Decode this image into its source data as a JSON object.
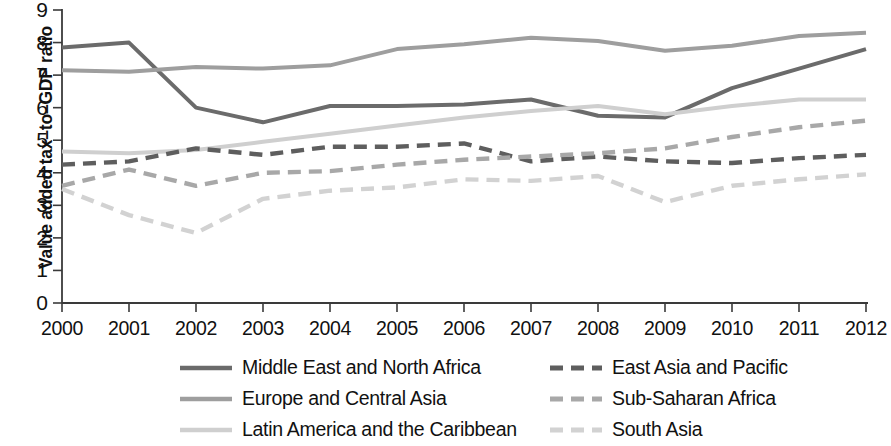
{
  "chart_data": {
    "type": "line",
    "title": "",
    "xlabel": "",
    "ylabel": "Value added tax–to–GDP ratio",
    "x": [
      2000,
      2001,
      2002,
      2003,
      2004,
      2005,
      2006,
      2007,
      2008,
      2009,
      2010,
      2011,
      2012
    ],
    "categories": [
      "2000",
      "2001",
      "2002",
      "2003",
      "2004",
      "2005",
      "2006",
      "2007",
      "2008",
      "2009",
      "2010",
      "2011",
      "2012"
    ],
    "xlim": [
      2000,
      2012
    ],
    "ylim": [
      0,
      9
    ],
    "yticks": [
      0,
      1,
      2,
      3,
      4,
      5,
      6,
      7,
      8,
      9
    ],
    "grid": false,
    "legend_position": "bottom",
    "series": [
      {
        "name": "Middle East and North Africa",
        "style": "solid",
        "color": "#6b6b6b",
        "values": [
          7.85,
          8.0,
          6.0,
          5.55,
          6.05,
          6.05,
          6.1,
          6.25,
          5.75,
          5.7,
          6.6,
          7.2,
          7.8
        ]
      },
      {
        "name": "Europe and Central Asia",
        "style": "solid",
        "color": "#9e9e9e",
        "values": [
          7.15,
          7.1,
          7.25,
          7.2,
          7.3,
          7.8,
          7.95,
          8.15,
          8.05,
          7.75,
          7.9,
          8.2,
          8.3
        ]
      },
      {
        "name": "Latin America and the Caribbean",
        "style": "solid",
        "color": "#cfcfcf",
        "values": [
          4.65,
          4.6,
          4.7,
          4.95,
          5.2,
          5.45,
          5.7,
          5.9,
          6.05,
          5.8,
          6.05,
          6.25,
          6.25
        ]
      },
      {
        "name": "East Asia and Pacific",
        "style": "dashed",
        "color": "#5e5e5e",
        "values": [
          4.25,
          4.35,
          4.75,
          4.55,
          4.8,
          4.8,
          4.9,
          4.35,
          4.5,
          4.35,
          4.3,
          4.45,
          4.55
        ]
      },
      {
        "name": "Sub-Saharan Africa",
        "style": "dashed",
        "color": "#a8a8a8",
        "values": [
          3.6,
          4.1,
          3.6,
          4.0,
          4.05,
          4.25,
          4.4,
          4.5,
          4.6,
          4.75,
          5.1,
          5.4,
          5.6
        ]
      },
      {
        "name": "South Asia",
        "style": "dashed",
        "color": "#d2d2d2",
        "values": [
          3.5,
          2.7,
          2.15,
          3.2,
          3.45,
          3.55,
          3.8,
          3.75,
          3.9,
          3.1,
          3.6,
          3.8,
          3.95
        ]
      }
    ]
  },
  "axis": {
    "y_tick_labels": [
      "9",
      "8",
      "7",
      "6",
      "5",
      "4",
      "3",
      "2",
      "1",
      "0"
    ],
    "x_tick_labels": [
      "2000",
      "2001",
      "2002",
      "2003",
      "2004",
      "2005",
      "2006",
      "2007",
      "2008",
      "2009",
      "2010",
      "2011",
      "2012"
    ],
    "y_axis_title": "Value added tax–to–GDP ratio"
  },
  "legend": {
    "left_column": [
      {
        "label": "Middle East and North Africa",
        "color": "#6b6b6b",
        "style": "solid"
      },
      {
        "label": "Europe and Central Asia",
        "color": "#9e9e9e",
        "style": "solid"
      },
      {
        "label": "Latin America and the Caribbean",
        "color": "#cfcfcf",
        "style": "solid"
      }
    ],
    "right_column": [
      {
        "label": "East Asia and Pacific",
        "color": "#5e5e5e",
        "style": "dashed"
      },
      {
        "label": "Sub-Saharan Africa",
        "color": "#a8a8a8",
        "style": "dashed"
      },
      {
        "label": "South Asia",
        "color": "#d2d2d2",
        "style": "dashed"
      }
    ]
  }
}
